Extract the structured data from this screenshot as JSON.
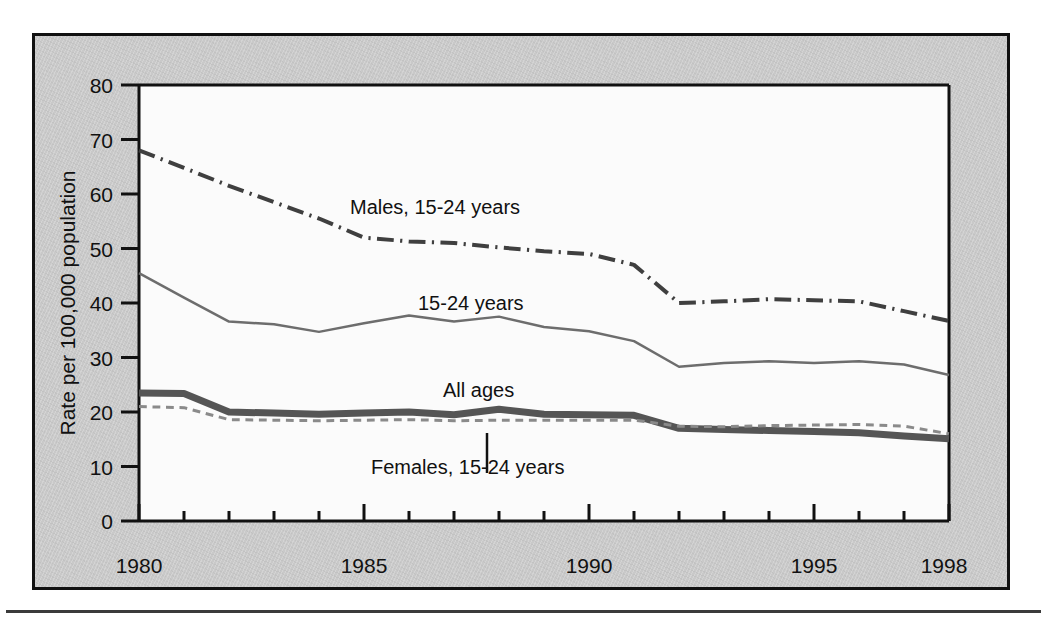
{
  "chart_data": {
    "type": "line",
    "title": "",
    "xlabel": "",
    "ylabel": "Rate per 100,000 population",
    "xlim": [
      1980,
      1998
    ],
    "ylim": [
      0,
      80
    ],
    "grid": false,
    "legend_position": "inline-annotations",
    "y_ticks": [
      0,
      10,
      20,
      30,
      40,
      50,
      60,
      70,
      80
    ],
    "y_tick_labels": [
      "0",
      "10",
      "20",
      "30",
      "40",
      "50",
      "60",
      "70",
      "80"
    ],
    "x_ticks": [
      1980,
      1981,
      1982,
      1983,
      1984,
      1985,
      1986,
      1987,
      1988,
      1989,
      1990,
      1991,
      1992,
      1993,
      1994,
      1995,
      1996,
      1997,
      1998
    ],
    "x_tick_labels_shown": [
      "1980",
      "1985",
      "1990",
      "1995",
      "1998"
    ],
    "x_major_ticks": [
      1980,
      1985,
      1990,
      1995,
      1998
    ],
    "x": [
      1980,
      1981,
      1982,
      1983,
      1984,
      1985,
      1986,
      1987,
      1988,
      1989,
      1990,
      1991,
      1992,
      1993,
      1994,
      1995,
      1996,
      1997,
      1998
    ],
    "series": [
      {
        "name": "Males, 15-24 years",
        "label": "Males, 15-24 years",
        "style": "dash-dot",
        "color": "#3f3f3f",
        "width": 4,
        "values": [
          68.0,
          64.8,
          61.5,
          58.5,
          55.5,
          52.0,
          51.3,
          51.0,
          50.2,
          49.5,
          49.0,
          47.0,
          40.0,
          40.3,
          40.7,
          40.5,
          40.3,
          38.5,
          36.7
        ]
      },
      {
        "name": "15-24 years",
        "label": "15-24 years",
        "style": "solid-thin",
        "color": "#6d6d6d",
        "width": 2.5,
        "values": [
          45.5,
          41.0,
          36.6,
          36.1,
          34.7,
          36.3,
          37.7,
          36.6,
          37.5,
          35.6,
          34.8,
          33.0,
          28.3,
          29.0,
          29.3,
          29.0,
          29.3,
          28.7,
          26.8
        ]
      },
      {
        "name": "All ages",
        "label": "All ages",
        "style": "solid-thick",
        "color": "#555555",
        "width": 7,
        "values": [
          23.5,
          23.4,
          20.0,
          19.8,
          19.6,
          19.8,
          20.0,
          19.5,
          20.5,
          19.6,
          19.5,
          19.4,
          17.0,
          16.8,
          16.6,
          16.4,
          16.2,
          15.6,
          15.1
        ]
      },
      {
        "name": "Females, 15-24 years",
        "label": "Females, 15-24 years",
        "style": "dashed",
        "color": "#8a8a8a",
        "width": 3,
        "values": [
          21.0,
          20.8,
          18.6,
          18.5,
          18.4,
          18.5,
          18.6,
          18.4,
          18.5,
          18.5,
          18.5,
          18.5,
          17.4,
          17.3,
          17.5,
          17.6,
          17.7,
          17.4,
          16.0
        ]
      }
    ],
    "annotations": [
      {
        "text": "Males, 15-24 years",
        "x_px": 347,
        "y_px": 204
      },
      {
        "text": "15-24 years",
        "x_px": 415,
        "y_px": 300
      },
      {
        "text": "All ages",
        "x_px": 440,
        "y_px": 387
      },
      {
        "text": "Females, 15-24 years",
        "x_px": 368,
        "y_px": 464
      }
    ]
  },
  "axes": {
    "y_axis_title": "Rate per 100,000 population"
  }
}
